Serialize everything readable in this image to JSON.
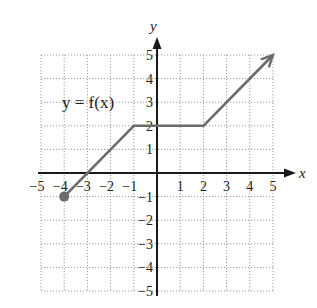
{
  "chart_data": {
    "type": "line",
    "title": "",
    "function_label": "y = f(x)",
    "xlabel": "x",
    "ylabel": "y",
    "xlim": [
      -5,
      5
    ],
    "ylim": [
      -5,
      5
    ],
    "grid": true,
    "x_ticks": [
      "-5",
      "-4",
      "-3",
      "-2",
      "-1",
      "1",
      "2",
      "3",
      "4",
      "5"
    ],
    "y_ticks": [
      "5",
      "4",
      "3",
      "2",
      "1",
      "-1",
      "-2",
      "-3",
      "-4",
      "-5"
    ],
    "series": [
      {
        "name": "f(x)",
        "points": [
          [
            -4,
            -1
          ],
          [
            -1,
            2
          ],
          [
            2,
            2
          ],
          [
            5,
            5
          ]
        ],
        "start_marker": "closed-dot",
        "end_marker": "arrow",
        "color": "#6b6b6b"
      }
    ]
  },
  "labels": {
    "function": "y = f(x)",
    "x_axis": "x",
    "y_axis": "y"
  },
  "colors": {
    "curve": "#6b6b6b",
    "axis": "#1a1a1a",
    "grid": "#9a9a9a"
  }
}
